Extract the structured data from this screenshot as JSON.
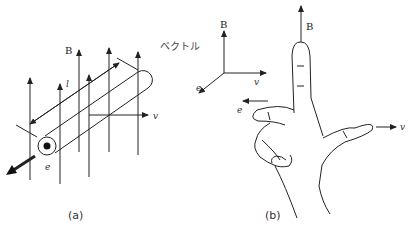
{
  "figure_a": {
    "caption": "(a)",
    "labels": {
      "B": "B",
      "l": "l",
      "v": "v",
      "e": "e"
    }
  },
  "vector_axes": {
    "title": "ベクトル",
    "labels": {
      "B": "B",
      "v": "v",
      "e": "e"
    }
  },
  "figure_b": {
    "caption": "(b)",
    "labels": {
      "B": "B",
      "v": "v",
      "e": "e"
    }
  },
  "colors": {
    "line": "#222222",
    "background": "#ffffff"
  }
}
